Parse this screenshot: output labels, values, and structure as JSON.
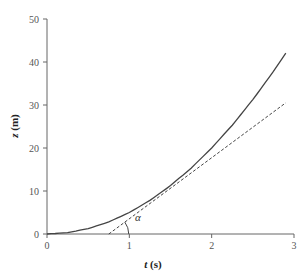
{
  "chart_data": {
    "type": "line",
    "title": "",
    "xlabel": "t (s)",
    "ylabel": "z (m)",
    "xlim": [
      0,
      3
    ],
    "ylim": [
      0,
      50
    ],
    "xticks": [
      0,
      1,
      2,
      3
    ],
    "yticks": [
      0,
      10,
      20,
      30,
      40,
      50
    ],
    "grid": false,
    "legend": null,
    "series": [
      {
        "name": "z(t)",
        "style": "solid",
        "color": "#444444",
        "x": [
          0,
          0.25,
          0.5,
          0.75,
          1.0,
          1.25,
          1.5,
          1.75,
          2.0,
          2.25,
          2.5,
          2.75,
          2.9
        ],
        "y": [
          0,
          0.31,
          1.25,
          2.81,
          5.0,
          7.81,
          11.25,
          15.31,
          20.0,
          25.31,
          31.25,
          37.81,
          42.05
        ]
      },
      {
        "name": "tangent",
        "style": "dashed",
        "color": "#444444",
        "x": [
          0.75,
          2.9
        ],
        "y": [
          0,
          30.5
        ]
      }
    ],
    "annotations": [
      {
        "text": "α",
        "x": 1.08,
        "y": 3.5,
        "description": "angle between tangent line and t-axis"
      }
    ]
  },
  "labels": {
    "xlabel_var": "t",
    "xlabel_unit": " (s)",
    "ylabel_var": "z",
    "ylabel_unit": " (m)",
    "alpha": "α"
  }
}
